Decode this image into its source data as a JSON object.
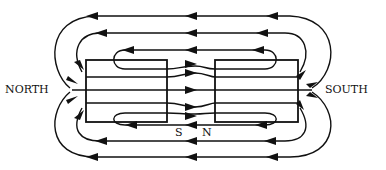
{
  "diagram": {
    "labels": {
      "left_pole": "NORTH",
      "right_pole": "SOUTH",
      "gap_left": "S",
      "gap_right": "N"
    },
    "magnets": [
      {
        "name": "left-magnet",
        "facing_gap_pole": "S",
        "outer_pole": "NORTH"
      },
      {
        "name": "right-magnet",
        "facing_gap_pole": "N",
        "outer_pole": "SOUTH"
      }
    ],
    "field_lines": {
      "outer_loops_top": 3,
      "outer_loops_bottom": 3,
      "through_lines": 5,
      "direction_outside": "right-to-left",
      "direction_through_gap": "left-to-right"
    },
    "colors": {
      "ink": "#111111",
      "background": "#ffffff"
    }
  }
}
